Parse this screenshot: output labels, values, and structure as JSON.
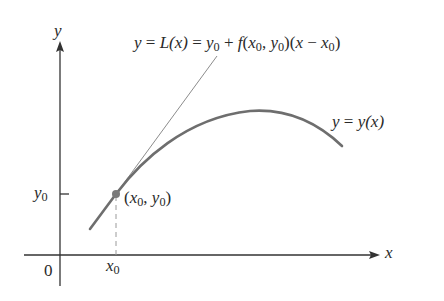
{
  "diagram": {
    "type": "tangent-line-approximation",
    "colors": {
      "axes": "#333333",
      "curve": "#6e6e6e",
      "tangent": "#8c8c8c",
      "point": "#7a7a7a",
      "dashed": "#9a9a9a",
      "text": "#2a2a2a",
      "background": "#ffffff"
    },
    "axes": {
      "x_label": "x",
      "y_label": "y",
      "origin_label": "0",
      "x_tick_label": {
        "var": "x",
        "sub": "0"
      },
      "y_tick_label": {
        "var": "y",
        "sub": "0"
      }
    },
    "point": {
      "label_open": "(",
      "x_var": "x",
      "x_sub": "0",
      "sep": ", ",
      "y_var": "y",
      "y_sub": "0",
      "label_close": ")"
    },
    "curve_label": {
      "lhs": "y",
      "eq": " = ",
      "rhs": "y(x)"
    },
    "tangent_label": {
      "p1": "y",
      "p2": " = ",
      "p3": "L(x)",
      "p4": " = ",
      "p5": "y",
      "p5_sub": "0",
      "p6": " + ",
      "p7": "f",
      "p8": "(",
      "p9": "x",
      "p9_sub": "0",
      "p10": ", ",
      "p11": "y",
      "p11_sub": "0",
      "p12": ")(",
      "p13": "x",
      "p14": " − ",
      "p15": "x",
      "p15_sub": "0",
      "p16": ")"
    }
  }
}
